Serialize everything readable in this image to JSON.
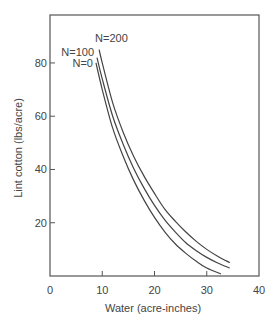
{
  "chart_data": {
    "type": "line",
    "title": "",
    "xlabel": "Water (acre-inches)",
    "ylabel": "Lint cotton (lbs/acre)",
    "xlim": [
      0,
      40
    ],
    "ylim": [
      0,
      98
    ],
    "xticks": [
      0,
      10,
      20,
      30,
      40
    ],
    "yticks": [
      20,
      40,
      60,
      80
    ],
    "grid": false,
    "legend": "inline labels at curve starts",
    "series": [
      {
        "name": "N=0",
        "x": [
          8.8,
          10,
          12,
          14,
          16,
          18,
          20,
          22,
          24,
          26,
          28,
          30,
          32.7
        ],
        "y": [
          80,
          70,
          55.5,
          45,
          36,
          28.5,
          22,
          16.5,
          12,
          8.5,
          5.5,
          3,
          0.8
        ]
      },
      {
        "name": "N=100",
        "x": [
          9.0,
          10,
          12,
          14,
          16,
          18,
          20,
          22,
          24,
          26,
          28,
          30,
          32,
          34.4
        ],
        "y": [
          82,
          74,
          60,
          49.5,
          40.5,
          33,
          26.5,
          21,
          16.5,
          12.5,
          9.5,
          7,
          5,
          3
        ]
      },
      {
        "name": "N=200",
        "x": [
          9.4,
          10,
          12,
          14,
          16,
          18,
          20,
          22,
          24,
          26,
          28,
          30,
          32,
          34.4
        ],
        "y": [
          85,
          80,
          65,
          54,
          45,
          37.5,
          31,
          25,
          20.5,
          16.5,
          13,
          10,
          7.5,
          5
        ]
      }
    ]
  }
}
